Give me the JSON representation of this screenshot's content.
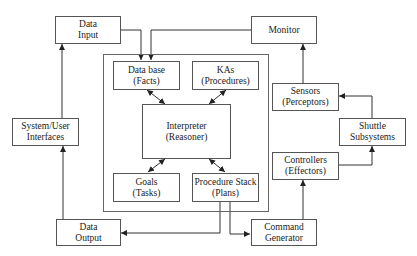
{
  "diagram": {
    "title": "",
    "nodes": {
      "data_input": {
        "line1": "Data",
        "line2": "Input"
      },
      "monitor": {
        "line1": "Monitor"
      },
      "system_user_interfaces": {
        "line1": "System/User",
        "line2": "Interfaces"
      },
      "data_output": {
        "line1": "Data",
        "line2": "Output"
      },
      "command_generator": {
        "line1": "Command",
        "line2": "Generator"
      },
      "data_base": {
        "line1": "Data base",
        "line2": "(Facts)"
      },
      "kas": {
        "line1": "KAs",
        "line2": "(Procedures)"
      },
      "interpreter": {
        "line1": "Interpreter",
        "line2": "(Reasoner)"
      },
      "goals": {
        "line1": "Goals",
        "line2": "(Tasks)"
      },
      "procedure_stack": {
        "line1": "Procedure Stack",
        "line2": "(Plans)"
      },
      "sensors": {
        "line1": "Sensors",
        "line2": "(Perceptors)"
      },
      "controllers": {
        "line1": "Controllers",
        "line2": "(Effectors)"
      },
      "shuttle_subsystems": {
        "line1": "Shuttle",
        "line2": "Subsystems"
      }
    },
    "edges": [
      {
        "from": "Data Input",
        "to": "Data base (Facts)"
      },
      {
        "from": "Monitor",
        "to": "Data base (Facts)"
      },
      {
        "from": "System/User Interfaces",
        "to": "Data Input"
      },
      {
        "from": "Data Output",
        "to": "System/User Interfaces"
      },
      {
        "from": "Data base (Facts)",
        "to": "Interpreter (Reasoner)",
        "bidirectional": true
      },
      {
        "from": "KAs (Procedures)",
        "to": "Interpreter (Reasoner)",
        "bidirectional": true
      },
      {
        "from": "Interpreter (Reasoner)",
        "to": "Goals (Tasks)",
        "bidirectional": true
      },
      {
        "from": "Interpreter (Reasoner)",
        "to": "Procedure Stack (Plans)",
        "bidirectional": true
      },
      {
        "from": "Procedure Stack (Plans)",
        "to": "Data Output"
      },
      {
        "from": "Procedure Stack (Plans)",
        "to": "Command Generator"
      },
      {
        "from": "Command Generator",
        "to": "Controllers (Effectors)"
      },
      {
        "from": "Controllers (Effectors)",
        "to": "Shuttle Subsystems"
      },
      {
        "from": "Shuttle Subsystems",
        "to": "Sensors (Perceptors)"
      },
      {
        "from": "Sensors (Perceptors)",
        "to": "Monitor"
      }
    ]
  }
}
